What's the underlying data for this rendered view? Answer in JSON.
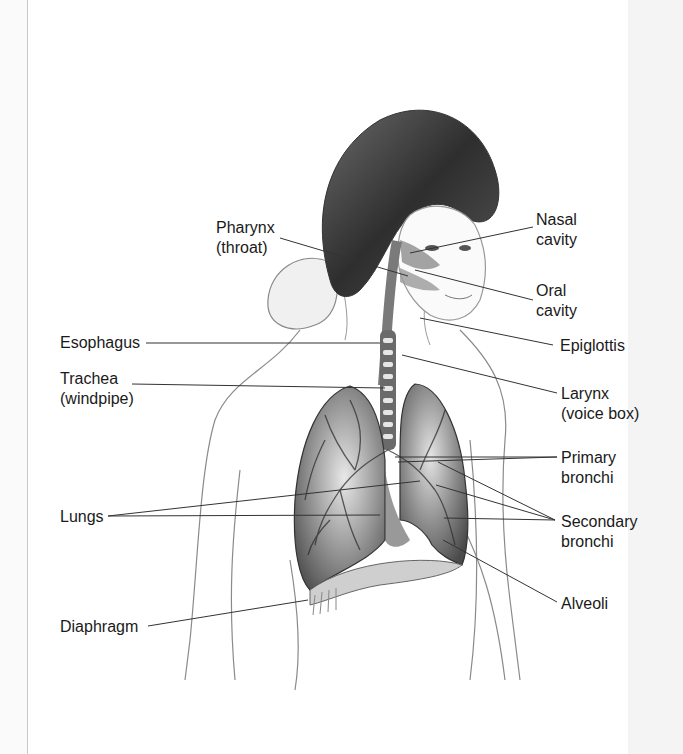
{
  "figure": {
    "labels": {
      "pharynx": [
        "Pharynx",
        "(throat)"
      ],
      "nasal_cavity": [
        "Nasal",
        "cavity"
      ],
      "oral_cavity": [
        "Oral",
        "cavity"
      ],
      "esophagus": [
        "Esophagus"
      ],
      "epiglottis": [
        "Epiglottis"
      ],
      "trachea": [
        "Trachea",
        "(windpipe)"
      ],
      "larynx": [
        "Larynx",
        "(voice box)"
      ],
      "primary_bronchi": [
        "Primary",
        "bronchi"
      ],
      "lungs": [
        "Lungs"
      ],
      "secondary_bronchi": [
        "Secondary",
        "bronchi"
      ],
      "alveoli": [
        "Alveoli"
      ],
      "diaphragm": [
        "Diaphragm"
      ]
    },
    "colors": {
      "leader_line": "#333333",
      "lung": "#5a5a5a",
      "hair": "#3a3a3a",
      "skin_line": "#8a8a8a"
    }
  }
}
